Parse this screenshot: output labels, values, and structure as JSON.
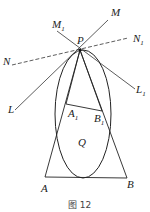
{
  "diagram": {
    "labels": {
      "P": "P",
      "M": "M",
      "M1": "M",
      "M1_sub": "1",
      "N": "N",
      "N1": "N",
      "N1_sub": "1",
      "L": "L",
      "L1": "L",
      "L1_sub": "1",
      "A": "A",
      "B": "B",
      "A1": "A",
      "A1_sub": "1",
      "B1": "B",
      "B1_sub": "1",
      "Q": "Q"
    },
    "caption": "图 12",
    "points": {
      "P": [
        80,
        50
      ],
      "A": [
        45,
        177
      ],
      "B": [
        127,
        178
      ],
      "A1": [
        66,
        104
      ],
      "B1": [
        102,
        111
      ]
    },
    "ellipse": {
      "cx": 83,
      "cy": 114,
      "rx": 28,
      "ry": 64
    }
  }
}
